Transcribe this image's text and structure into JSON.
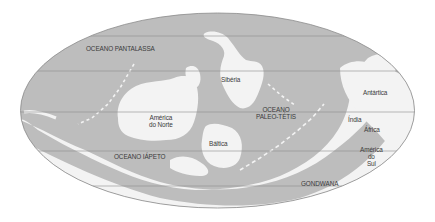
{
  "map": {
    "projection": "elliptical world map (Paleozoic)",
    "colors": {
      "ocean": "#bdbdbd",
      "land": "#f3f3f3",
      "border": "#8a8a8a",
      "gridline": "#8f8f8f",
      "label": "#3a3a3a",
      "background": "#ffffff"
    },
    "labels": {
      "pantalassa": "OCEANO PANTALASSA",
      "siberia": "Sibéria",
      "america_norte_1": "América",
      "america_norte_2": "do Norte",
      "paleo_tetis_1": "OCEANO",
      "paleo_tetis_2": "PALEO-TÉTIS",
      "baltica": "Báltica",
      "iapeto": "OCEANO IÁPETO",
      "antartica": "Antártica",
      "india": "Índia",
      "africa": "África",
      "america_sul_1": "América",
      "america_sul_2": "do",
      "america_sul_3": "Sul",
      "gondwana": "GONDWANA"
    }
  }
}
